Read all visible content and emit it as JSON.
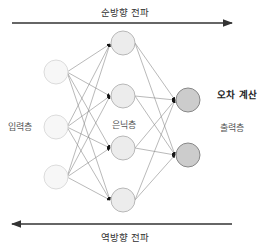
{
  "diagram": {
    "forward_label": "순방향 전파",
    "backward_label": "역방향 전파",
    "error_label": "오차 계산",
    "layers": {
      "input": {
        "label": "입력층",
        "count": 3,
        "fill": "#f7f7f7",
        "stroke": "#dddddd"
      },
      "hidden": {
        "label": "은닉층",
        "count": 4,
        "fill": "#eeeeee",
        "stroke": "#bbbbbb"
      },
      "output": {
        "label": "출력층",
        "count": 2,
        "fill": "#cccccc",
        "stroke": "#888888"
      }
    },
    "colors": {
      "arrow": "#333333",
      "edge": "#888888"
    }
  }
}
